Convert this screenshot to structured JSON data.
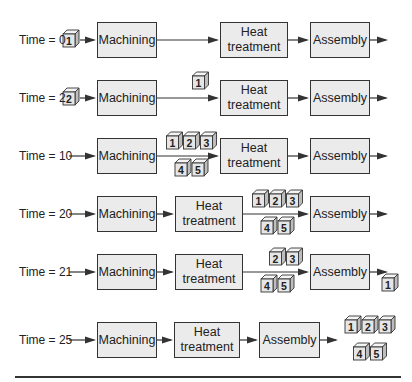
{
  "figure": {
    "title": "",
    "stages": [
      {
        "id": "machining",
        "label": "Machining"
      },
      {
        "id": "heat",
        "label": "Heat\ntreatment",
        "line1": "Heat",
        "line2": "treatment"
      },
      {
        "id": "assembly",
        "label": "Assembly"
      }
    ],
    "rows": [
      {
        "time_label": "Time = 0",
        "time": 0,
        "layout": "spread",
        "input_parts": [
          "1"
        ],
        "after_machining": [],
        "after_heat": [],
        "after_assembly": []
      },
      {
        "time_label": "Time = 2",
        "time": 2,
        "layout": "spread",
        "input_parts": [
          "2"
        ],
        "after_machining": [
          "1"
        ],
        "after_heat": [],
        "after_assembly": []
      },
      {
        "time_label": "Time = 10",
        "time": 10,
        "layout": "spread",
        "input_parts": [],
        "after_machining": [
          "1",
          "2",
          "3",
          "4",
          "5"
        ],
        "after_heat": [],
        "after_assembly": []
      },
      {
        "time_label": "Time = 20",
        "time": 20,
        "layout": "compact-heat",
        "input_parts": [],
        "after_machining": [],
        "after_heat": [
          "1",
          "2",
          "3",
          "4",
          "5"
        ],
        "after_assembly": []
      },
      {
        "time_label": "Time = 21",
        "time": 21,
        "layout": "compact-heat",
        "input_parts": [],
        "after_machining": [],
        "after_heat": [
          "2",
          "3",
          "4",
          "5"
        ],
        "after_assembly": [
          "1"
        ]
      },
      {
        "time_label": "Time = 25",
        "time": 25,
        "layout": "compact-all",
        "input_parts": [],
        "after_machining": [],
        "after_heat": [],
        "after_assembly": [
          "1",
          "2",
          "3",
          "4",
          "5"
        ]
      }
    ],
    "icons": {
      "part": "cube-icon",
      "flow": "arrow-right-icon"
    },
    "colors": {
      "box_fill": "#ebebeb",
      "stroke": "#333333",
      "cube_front": "#e6e6e6",
      "cube_top": "#f4f4f4",
      "cube_side": "#bdbdbd"
    }
  }
}
